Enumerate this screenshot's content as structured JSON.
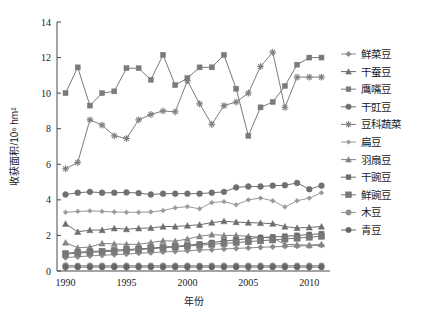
{
  "chart_data": {
    "type": "line",
    "title": "",
    "xlabel": "年份",
    "ylabel": "收获面积/10⁶ hm²",
    "xlim": [
      1989.3,
      2011.7
    ],
    "ylim": [
      0,
      14
    ],
    "yticks": [
      0,
      2,
      4,
      6,
      8,
      10,
      12,
      14
    ],
    "xticks": [
      1990,
      1995,
      2000,
      2005,
      2010
    ],
    "grid": false,
    "legend_position": "right",
    "x": [
      1990,
      1991,
      1992,
      1993,
      1994,
      1995,
      1996,
      1997,
      1998,
      1999,
      2000,
      2001,
      2002,
      2003,
      2004,
      2005,
      2006,
      2007,
      2008,
      2009,
      2010,
      2011
    ],
    "series": [
      {
        "name": "鲜菜豆",
        "marker": "diamond",
        "color": "#8a8a8a",
        "values": [
          0.75,
          0.8,
          0.85,
          0.88,
          0.92,
          0.95,
          1.0,
          1.03,
          1.07,
          1.1,
          1.14,
          1.18,
          1.2,
          1.24,
          1.27,
          1.3,
          1.33,
          1.36,
          1.38,
          1.4,
          1.42,
          1.45
        ]
      },
      {
        "name": "干蚕豆",
        "marker": "triangle",
        "color": "#6e6e6e",
        "values": [
          2.65,
          2.2,
          2.3,
          2.3,
          2.4,
          2.35,
          2.4,
          2.42,
          2.5,
          2.5,
          2.55,
          2.6,
          2.72,
          2.8,
          2.75,
          2.72,
          2.7,
          2.66,
          2.5,
          2.42,
          2.45,
          2.5
        ]
      },
      {
        "name": "鹰嘴豆",
        "marker": "square",
        "color": "#7a7a7a",
        "values": [
          10.0,
          11.45,
          9.3,
          10.0,
          10.1,
          11.4,
          11.4,
          10.75,
          12.15,
          10.45,
          10.85,
          11.45,
          11.45,
          12.15,
          10.25,
          7.6,
          9.2,
          9.5,
          10.4,
          11.6,
          12.0,
          12.0
        ]
      },
      {
        "name": "干豇豆",
        "marker": "circle",
        "color": "#707070",
        "values": [
          4.3,
          4.4,
          4.45,
          4.4,
          4.4,
          4.42,
          4.38,
          4.3,
          4.35,
          4.35,
          4.35,
          4.35,
          4.4,
          4.45,
          4.7,
          4.75,
          4.75,
          4.8,
          4.82,
          4.95,
          4.6,
          4.8
        ]
      },
      {
        "name": "豆科蔬菜",
        "marker": "star",
        "color": "#7d7d7d",
        "values": [
          5.75,
          6.1,
          8.5,
          8.2,
          7.6,
          7.45,
          8.5,
          8.8,
          9.0,
          8.95,
          10.7,
          9.4,
          8.25,
          9.3,
          9.5,
          10.0,
          11.5,
          12.3,
          9.2,
          10.9,
          10.9,
          10.9
        ]
      },
      {
        "name": "扁豆",
        "marker": "small-diamond",
        "color": "#9a9a9a",
        "values": [
          3.3,
          3.35,
          3.38,
          3.35,
          3.32,
          3.3,
          3.3,
          3.32,
          3.4,
          3.55,
          3.62,
          3.5,
          3.85,
          3.9,
          3.72,
          4.0,
          4.1,
          3.95,
          3.6,
          3.95,
          4.1,
          4.4
        ]
      },
      {
        "name": "羽扇豆",
        "marker": "triangle",
        "color": "#858585",
        "values": [
          1.6,
          1.3,
          1.35,
          1.55,
          1.52,
          1.5,
          1.5,
          1.6,
          1.7,
          1.68,
          1.8,
          1.95,
          2.05,
          2.0,
          2.0,
          1.95,
          1.9,
          1.85,
          1.5,
          1.48,
          1.45,
          1.5
        ]
      },
      {
        "name": "干豌豆",
        "marker": "square",
        "color": "#6a6a6a",
        "values": [
          1.0,
          1.05,
          1.1,
          1.12,
          1.18,
          1.2,
          1.25,
          1.28,
          1.35,
          1.38,
          1.45,
          1.52,
          1.6,
          1.68,
          1.75,
          1.82,
          1.88,
          1.92,
          1.95,
          2.0,
          2.05,
          2.1
        ]
      },
      {
        "name": "鲜豌豆",
        "marker": "square-large",
        "color": "#787878",
        "values": [
          0.95,
          1.0,
          1.05,
          1.08,
          1.12,
          1.15,
          1.2,
          1.25,
          1.3,
          1.35,
          1.4,
          1.45,
          1.5,
          1.55,
          1.6,
          1.65,
          1.7,
          1.75,
          1.8,
          1.85,
          1.9,
          1.95
        ]
      },
      {
        "name": "木豆",
        "marker": "circle",
        "color": "#8e8e8e",
        "values": [
          0.32,
          0.3,
          0.3,
          0.3,
          0.3,
          0.3,
          0.3,
          0.3,
          0.3,
          0.3,
          0.3,
          0.3,
          0.3,
          0.3,
          0.3,
          0.3,
          0.3,
          0.3,
          0.3,
          0.3,
          0.3,
          0.3
        ]
      },
      {
        "name": "青豆",
        "marker": "circle",
        "color": "#666666",
        "values": [
          0.22,
          0.22,
          0.22,
          0.22,
          0.22,
          0.22,
          0.22,
          0.22,
          0.22,
          0.22,
          0.22,
          0.22,
          0.22,
          0.22,
          0.22,
          0.22,
          0.22,
          0.22,
          0.22,
          0.22,
          0.22,
          0.22
        ]
      }
    ]
  }
}
